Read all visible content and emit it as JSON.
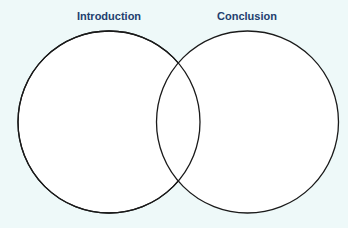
{
  "diagram": {
    "type": "venn",
    "sets": [
      {
        "label": "Introduction"
      },
      {
        "label": "Conclusion"
      }
    ],
    "colors": {
      "background": "#eef9f9",
      "circle_fill": "#ffffff",
      "circle_stroke": "#1a1a1a",
      "label": "#22406e"
    }
  }
}
